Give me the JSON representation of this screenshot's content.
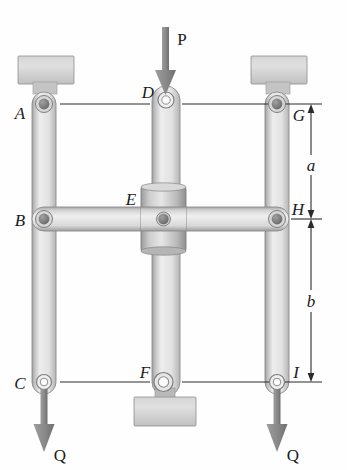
{
  "figure": {
    "background_color": "#fefefe",
    "metal_light": "#e3e3e3",
    "metal_mid": "#c9c9c9",
    "metal_dark": "#9a9a9a",
    "pin_dark": "#6e6e6e",
    "line_color": "#2a2a2a",
    "arrow_color": "#8a8a8a"
  },
  "labels": {
    "A": "A",
    "B": "B",
    "C": "C",
    "D": "D",
    "E": "E",
    "F": "F",
    "G": "G",
    "H": "H",
    "I": "I",
    "P": "P",
    "Q_left": "Q",
    "Q_right": "Q"
  },
  "dimensions": {
    "a": "a",
    "b": "b"
  },
  "forces": [
    {
      "name": "P",
      "label": "P",
      "direction": "down",
      "applied_at": "D"
    },
    {
      "name": "Q_left",
      "label": "Q",
      "direction": "down",
      "applied_at": "C"
    },
    {
      "name": "Q_right",
      "label": "Q",
      "direction": "down",
      "applied_at": "I"
    }
  ],
  "joints": [
    {
      "name": "A",
      "type": "pin-filled",
      "x": 44,
      "y": 104
    },
    {
      "name": "B",
      "type": "pin-filled",
      "x": 44,
      "y": 219
    },
    {
      "name": "C",
      "type": "pin-hollow",
      "x": 44,
      "y": 382
    },
    {
      "name": "D",
      "type": "pin-hollow",
      "x": 166,
      "y": 100
    },
    {
      "name": "E",
      "type": "pin-filled",
      "x": 163,
      "y": 219
    },
    {
      "name": "F",
      "type": "pin-hollow",
      "x": 163,
      "y": 382
    },
    {
      "name": "G",
      "type": "pin-filled",
      "x": 277,
      "y": 104
    },
    {
      "name": "H",
      "type": "pin-filled",
      "x": 277,
      "y": 219
    },
    {
      "name": "I",
      "type": "pin-hollow",
      "x": 277,
      "y": 382
    }
  ],
  "members": [
    {
      "name": "left-vertical-bar",
      "from": "A",
      "to": "C"
    },
    {
      "name": "right-vertical-bar",
      "from": "G",
      "to": "I"
    },
    {
      "name": "center-vertical-bar",
      "from": "D",
      "to": "F"
    },
    {
      "name": "horizontal-bar-BEH",
      "from": "B",
      "to": "H"
    }
  ],
  "supports": [
    {
      "name": "top-left-support-block"
    },
    {
      "name": "top-right-support-block"
    },
    {
      "name": "bottom-center-support-block"
    }
  ]
}
